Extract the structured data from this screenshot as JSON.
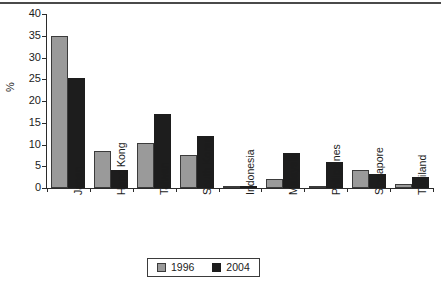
{
  "chart_data": {
    "type": "bar",
    "title": "",
    "subtitle": "",
    "xlabel": "",
    "ylabel": "%",
    "ylim": [
      0,
      40
    ],
    "yticks": [
      0,
      5,
      10,
      15,
      20,
      25,
      30,
      35,
      40
    ],
    "grid": false,
    "legend_position": "bottom-center",
    "categories": [
      "Japan",
      "Hong Kong",
      "Taiwan",
      "South Korea",
      "Indonesia",
      "Malaysia",
      "Philippines",
      "Singapore",
      "Thailand"
    ],
    "series": [
      {
        "name": "1996",
        "color": "#9a9a9a",
        "values": [
          35.0,
          8.5,
          10.3,
          7.5,
          0.2,
          2.0,
          0.5,
          4.1,
          1.0
        ]
      },
      {
        "name": "2004",
        "color": "#1d1d1d",
        "values": [
          25.3,
          4.2,
          17.0,
          12.0,
          0.5,
          8.0,
          6.0,
          3.3,
          2.5
        ]
      }
    ]
  },
  "legend": {
    "items": [
      {
        "label": "1996"
      },
      {
        "label": "2004"
      }
    ]
  }
}
